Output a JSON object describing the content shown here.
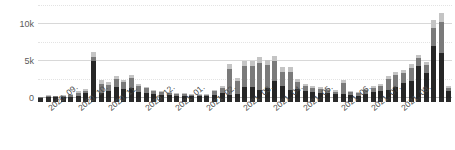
{
  "chart_data": {
    "type": "bar",
    "title": "",
    "subtitle": "",
    "xlabel": "",
    "ylabel": "",
    "stacked": true,
    "grid": true,
    "legend_position": "none",
    "ylim": [
      0,
      12500
    ],
    "ytick_labels": [
      "0",
      "5k",
      "10k"
    ],
    "ytick_values": [
      0,
      5000,
      10000
    ],
    "minor_gridline_values": [
      2500,
      7500,
      12500
    ],
    "xtick_labels": [
      "2020. 09.",
      "2020. 10.",
      "2020. 11.",
      "2020. 12.",
      "2021. 01.",
      "2021. 02.",
      "2021. 03.",
      "2021. 04.",
      "2021. 05.",
      "2021. 06.",
      "2021. 07.",
      "2021. 08."
    ],
    "xtick_positions": [
      1,
      5,
      9,
      14,
      18,
      22,
      27,
      31,
      35,
      40,
      44,
      48
    ],
    "series": [
      {
        "name": "segment-dark",
        "color": "#262626",
        "values": [
          60,
          180,
          150,
          170,
          200,
          330,
          620,
          5050,
          620,
          900,
          1500,
          1200,
          1300,
          800,
          700,
          500,
          430,
          360,
          300,
          290,
          250,
          240,
          230,
          420,
          620,
          360,
          500,
          1450,
          1500,
          1150,
          1300,
          2250,
          1650,
          1100,
          1250,
          900,
          800,
          700,
          650,
          480,
          500,
          420,
          340,
          600,
          780,
          950,
          1150,
          1450,
          2050,
          2350,
          4300,
          3450,
          7050,
          6100,
          900
        ]
      },
      {
        "name": "segment-medium",
        "color": "#7a7a7a",
        "values": [
          60,
          130,
          120,
          140,
          180,
          420,
          380,
          550,
          1350,
          900,
          1100,
          950,
          1400,
          800,
          600,
          420,
          380,
          300,
          260,
          240,
          220,
          200,
          190,
          480,
          700,
          3600,
          1800,
          2900,
          2800,
          3600,
          3150,
          2750,
          1900,
          2400,
          950,
          700,
          600,
          520,
          500,
          400,
          1500,
          420,
          340,
          480,
          560,
          700,
          1400,
          1650,
          1300,
          1700,
          1200,
          1100,
          2400,
          4200,
          500
        ]
      },
      {
        "name": "segment-light",
        "color": "#c4c4c4",
        "values": [
          40,
          80,
          70,
          90,
          110,
          250,
          230,
          600,
          450,
          400,
          420,
          350,
          450,
          300,
          250,
          180,
          160,
          140,
          120,
          110,
          100,
          90,
          85,
          200,
          280,
          600,
          400,
          650,
          800,
          800,
          750,
          650,
          600,
          700,
          400,
          300,
          260,
          230,
          200,
          160,
          400,
          180,
          150,
          200,
          240,
          300,
          450,
          500,
          500,
          550,
          350,
          300,
          1100,
          1200,
          220
        ]
      }
    ]
  }
}
